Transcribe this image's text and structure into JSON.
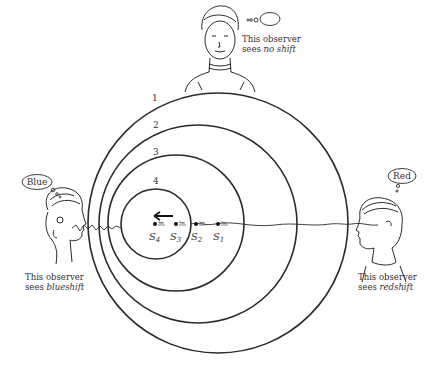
{
  "observers": {
    "top": {
      "thought": "",
      "caption_line1": "This observer",
      "caption_line2_prefix": "sees ",
      "caption_line2_emph": "no shift"
    },
    "left": {
      "thought": "Blue",
      "caption_line1": "This observer",
      "caption_line2_prefix": "sees ",
      "caption_line2_emph": "blueshift"
    },
    "right": {
      "thought": "Red",
      "caption_line1": "This observer",
      "caption_line2_prefix": "sees ",
      "caption_line2_emph": "redshift"
    }
  },
  "wavefronts": [
    {
      "label": "1",
      "cx": 218,
      "cy": 223,
      "r": 130
    },
    {
      "label": "2",
      "cx": 198,
      "cy": 224,
      "r": 99
    },
    {
      "label": "3",
      "cx": 176,
      "cy": 223,
      "r": 68
    },
    {
      "label": "4",
      "cx": 156,
      "cy": 224,
      "r": 35
    }
  ],
  "sources": [
    {
      "label": "S",
      "sub": "4",
      "x": 155
    },
    {
      "label": "S",
      "sub": "3",
      "x": 176
    },
    {
      "label": "S",
      "sub": "2",
      "x": 196
    },
    {
      "label": "S",
      "sub": "1",
      "x": 218
    }
  ],
  "motion": {
    "direction": "left"
  },
  "colors": {
    "ink": "#2a2a2a",
    "background": "#ffffff"
  }
}
